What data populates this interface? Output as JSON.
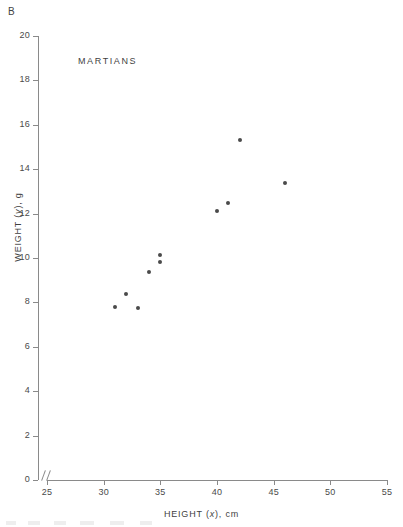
{
  "panel": {
    "letter": "B"
  },
  "labels": {
    "series_name": "MARTIANS",
    "x_axis_prefix": "HEIGHT (",
    "x_axis_var": "x",
    "x_axis_suffix": "), cm",
    "y_axis_prefix": "WEIGHT (",
    "y_axis_var": "y",
    "y_axis_suffix": "), g"
  },
  "axes": {
    "y_ticks": [
      "20",
      "18",
      "16",
      "14",
      "12",
      "10",
      "8",
      "6",
      "4",
      "2",
      "0"
    ],
    "x_ticks": [
      "25",
      "30",
      "35",
      "40",
      "45",
      "50",
      "55"
    ],
    "break_symbol": "//"
  },
  "colors": {
    "point": "#4a4a4a",
    "axis": "#8a8a8a",
    "text": "#3f3f3f",
    "background": "#ffffff"
  },
  "chart_data": {
    "type": "scatter",
    "title": "MARTIANS",
    "xlabel": "HEIGHT (x), cm",
    "ylabel": "WEIGHT (y), g",
    "xlim": [
      25,
      55
    ],
    "ylim": [
      0,
      20
    ],
    "xticks": [
      25,
      30,
      35,
      40,
      45,
      50,
      55
    ],
    "yticks": [
      0,
      2,
      4,
      6,
      8,
      10,
      12,
      14,
      16,
      18,
      20
    ],
    "grid": false,
    "legend": "none",
    "axis_break_x": true,
    "series": [
      {
        "name": "MARTIANS",
        "marker": "filled-circle",
        "points": [
          {
            "x": 31,
            "y": 7.8
          },
          {
            "x": 32,
            "y": 8.4
          },
          {
            "x": 33,
            "y": 7.75
          },
          {
            "x": 34,
            "y": 9.35
          },
          {
            "x": 35,
            "y": 9.8
          },
          {
            "x": 35,
            "y": 10.15
          },
          {
            "x": 40,
            "y": 12.1
          },
          {
            "x": 41,
            "y": 12.5
          },
          {
            "x": 42,
            "y": 15.3
          },
          {
            "x": 46,
            "y": 13.4
          }
        ]
      }
    ]
  }
}
